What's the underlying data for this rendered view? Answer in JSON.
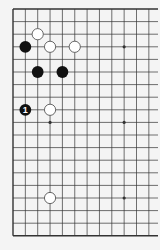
{
  "diagram": {
    "type": "go-board-diagram",
    "board_size": 19,
    "visible_columns": 12,
    "visible_rows": 19,
    "edges_visible": [
      "left",
      "top",
      "bottom"
    ],
    "origin": {
      "x": 13,
      "y": 9
    },
    "spacing": {
      "x": 12.35,
      "y": 12.6
    },
    "colors": {
      "background": "#f4f4f4",
      "line": "#333333",
      "black_stone": "#111111",
      "white_stone": "#ffffff",
      "white_stone_border": "#444444"
    },
    "star_points": [
      {
        "col": 9,
        "row": 3
      },
      {
        "col": 3,
        "row": 9
      },
      {
        "col": 9,
        "row": 9
      },
      {
        "col": 9,
        "row": 15
      }
    ],
    "stones": [
      {
        "color": "white",
        "col": 2,
        "row": 2,
        "label": ""
      },
      {
        "color": "black",
        "col": 1,
        "row": 3,
        "label": ""
      },
      {
        "color": "white",
        "col": 3,
        "row": 3,
        "label": ""
      },
      {
        "color": "white",
        "col": 5,
        "row": 3,
        "label": ""
      },
      {
        "color": "black",
        "col": 2,
        "row": 5,
        "label": ""
      },
      {
        "color": "black",
        "col": 4,
        "row": 5,
        "label": ""
      },
      {
        "color": "black",
        "col": 1,
        "row": 8,
        "label": "1"
      },
      {
        "color": "white",
        "col": 3,
        "row": 8,
        "label": ""
      },
      {
        "color": "white",
        "col": 3,
        "row": 15,
        "label": ""
      }
    ]
  }
}
